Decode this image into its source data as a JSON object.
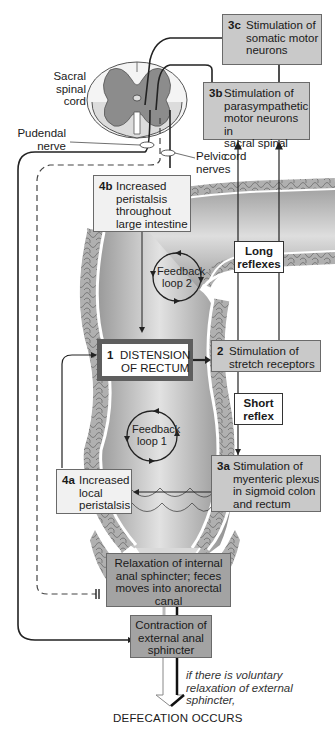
{
  "colors": {
    "box_light": "#f1f1f1",
    "box_mid": "#c9c9c9",
    "box_dark": "#a3a3a3",
    "gray_matter": "#8c8c8c",
    "rectum_lumen": "#b8b8b8",
    "wall_texture": "#a9a9a9"
  },
  "anatomy_labels": {
    "sacral_spinal_cord": "Sacral\nspinal\ncord",
    "pudendal_nerve": "Pudendal\nnerve",
    "pelvic_nerves": "Pelvic\nnerves"
  },
  "steps": {
    "s1": {
      "num": "1",
      "text": "DISTENSION\nOF RECTUM"
    },
    "s2": {
      "num": "2",
      "text": "Stimulation of\nstretch receptors"
    },
    "s3a": {
      "num": "3a",
      "text": "Stimulation of\nmyenteric plexus\nin sigmoid colon\nand rectum"
    },
    "s3b": {
      "num": "3b",
      "text": "Stimulation of\nparasympathetic\nmotor neurons in\nsacral spinal cord"
    },
    "s3c": {
      "num": "3c",
      "text": "Stimulation of\nsomatic motor\nneurons"
    },
    "s4a": {
      "num": "4a",
      "text": "Increased\nlocal\nperistalsis"
    },
    "s4b": {
      "num": "4b",
      "text": "Increased\nperistalsis\nthroughout\nlarge intestine"
    },
    "internal_sphincter": {
      "text": "Relaxation of internal\nanal sphincter; feces\nmoves into anorectal\ncanal"
    },
    "external_sphincter": {
      "text": "Contraction of\nexternal anal\nsphincter"
    }
  },
  "reflex_tags": {
    "long": "Long\nreflexes",
    "short": "Short\nreflex"
  },
  "feedback_loops": {
    "loop1": "Feedback\nloop 1",
    "loop2": "Feedback\nloop 2"
  },
  "condition_note": "if there is voluntary\nrelaxation of external\nsphincter,",
  "outcome": "DEFECATION OCCURS"
}
